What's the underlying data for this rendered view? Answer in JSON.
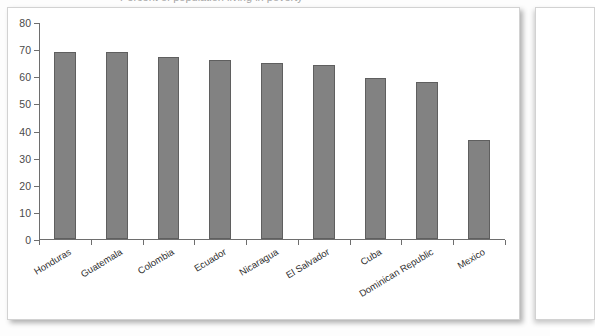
{
  "title_fragment": "Percent of population living in poverty",
  "chart_data": {
    "type": "bar",
    "title": "",
    "xlabel": "",
    "ylabel": "",
    "ylim": [
      0,
      80
    ],
    "ytick_step": 10,
    "yticks": [
      0,
      10,
      20,
      30,
      40,
      50,
      60,
      70,
      80
    ],
    "grid": false,
    "legend": false,
    "bar_color": "#828282",
    "bar_border_color": "#5f5f5f",
    "axis_color": "#6e6e6e",
    "categories": [
      "Honduras",
      "Guatemala",
      "Colombia",
      "Ecuador",
      "Nicaragua",
      "El Salvador",
      "Cuba",
      "Dominican Republic",
      "Mexico"
    ],
    "values": [
      69,
      69,
      67,
      66,
      65,
      64,
      59.5,
      58,
      36.5
    ]
  }
}
